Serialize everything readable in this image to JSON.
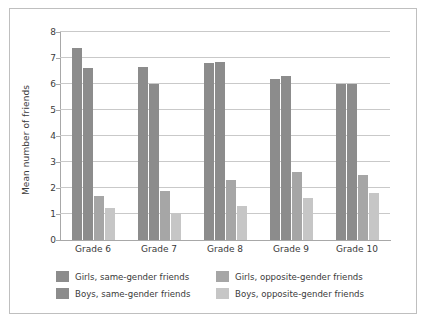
{
  "chart_data": {
    "type": "bar",
    "title": "",
    "xlabel": "",
    "ylabel": "Mean number of friends",
    "categories": [
      "Grade 6",
      "Grade 7",
      "Grade 8",
      "Grade 9",
      "Grade 10"
    ],
    "ylim": [
      0,
      8
    ],
    "yticks": [
      0,
      1,
      2,
      3,
      4,
      5,
      6,
      7,
      8
    ],
    "grid": true,
    "legend_position": "bottom",
    "series": [
      {
        "name": "Girls, same-gender friends",
        "color": "#8c8c8c",
        "values": [
          7.4,
          6.65,
          6.8,
          6.2,
          6.0
        ]
      },
      {
        "name": "Boys, same-gender friends",
        "color": "#8c8c8c",
        "values": [
          6.6,
          6.0,
          6.85,
          6.3,
          6.0
        ]
      },
      {
        "name": "Girls, opposite-gender friends",
        "color": "#a6a6a6",
        "values": [
          1.7,
          1.9,
          2.3,
          2.6,
          2.5
        ]
      },
      {
        "name": "Boys, opposite-gender friends",
        "color": "#c6c6c6",
        "values": [
          1.25,
          1.05,
          1.3,
          1.6,
          1.8
        ]
      }
    ]
  },
  "legend": {
    "items": [
      {
        "label": "Girls, same-gender friends",
        "color": "#8c8c8c"
      },
      {
        "label": "Girls, opposite-gender friends",
        "color": "#a6a6a6"
      },
      {
        "label": "Boys, same-gender friends",
        "color": "#8c8c8c"
      },
      {
        "label": "Boys, opposite-gender friends",
        "color": "#c6c6c6"
      }
    ]
  },
  "style": {
    "gridline_color": "#c9c9c9",
    "axis_color": "#a8a8a8",
    "text_color": "#3a3a3a",
    "frame_color": "#bfbfbf",
    "background": "#ffffff"
  }
}
